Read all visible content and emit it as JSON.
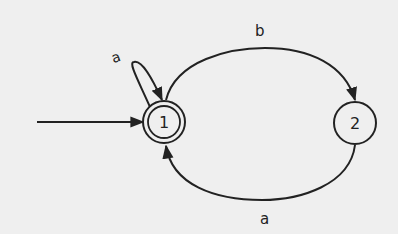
{
  "diagram": {
    "type": "finite-automaton",
    "colors": {
      "background": "#efefef",
      "stroke": "#222222"
    },
    "states": [
      {
        "id": "1",
        "label": "1",
        "initial": true,
        "accepting": true
      },
      {
        "id": "2",
        "label": "2",
        "initial": false,
        "accepting": false
      }
    ],
    "transitions": [
      {
        "from": "1",
        "to": "1",
        "label": "a"
      },
      {
        "from": "1",
        "to": "2",
        "label": "b"
      },
      {
        "from": "2",
        "to": "1",
        "label": "a"
      }
    ]
  }
}
